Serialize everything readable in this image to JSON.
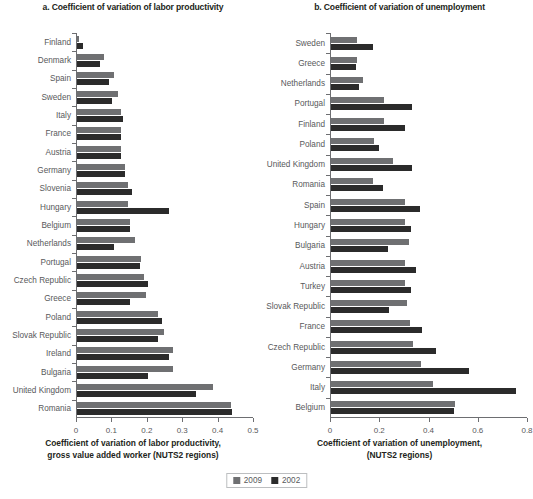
{
  "figure": {
    "legend": {
      "items": [
        {
          "label": "2009",
          "color": "#6f7072"
        },
        {
          "label": "2002",
          "color": "#2b2b2b"
        }
      ]
    }
  },
  "chart_data": [
    {
      "type": "bar",
      "orientation": "horizontal",
      "panel": "a",
      "title": "a. Coefficient of variation of labor productivity",
      "xlabel_line1": "Coefficient of variation of labor productivity,",
      "xlabel_line2": "gross value added worker (NUTS2 regions)",
      "ylabel": "",
      "xlim": [
        0,
        0.5
      ],
      "xticks": [
        0,
        0.1,
        0.2,
        0.3,
        0.4,
        0.5
      ],
      "xtick_labels": [
        "0",
        "0.1",
        "0.2",
        "0.3",
        "0.4",
        "0.5"
      ],
      "grid": false,
      "legend_position": "bottom-center",
      "categories": [
        "Finland",
        "Denmark",
        "Spain",
        "Sweden",
        "Italy",
        "France",
        "Austria",
        "Germany",
        "Slovenia",
        "Hungary",
        "Belgium",
        "Netherlands",
        "Portugal",
        "Czech Republic",
        "Greece",
        "Poland",
        "Slovak Republic",
        "Ireland",
        "Bulgaria",
        "United Kingdom",
        "Romania"
      ],
      "series": [
        {
          "name": "2009",
          "color": "#6f7072",
          "values": [
            0.005,
            0.075,
            0.105,
            0.115,
            0.125,
            0.125,
            0.125,
            0.135,
            0.145,
            0.145,
            0.15,
            0.165,
            0.18,
            0.19,
            0.195,
            0.23,
            0.245,
            0.27,
            0.27,
            0.385,
            0.435
          ]
        },
        {
          "name": "2002",
          "color": "#2b2b2b",
          "values": [
            0.018,
            0.065,
            0.09,
            0.1,
            0.13,
            0.125,
            0.125,
            0.135,
            0.155,
            0.26,
            0.15,
            0.105,
            0.178,
            0.2,
            0.15,
            0.24,
            0.23,
            0.26,
            0.2,
            0.335,
            0.437
          ]
        }
      ]
    },
    {
      "type": "bar",
      "orientation": "horizontal",
      "panel": "b",
      "title": "b. Coefficient of variation of unemployment",
      "xlabel_line1": "Coefficient of variation of unemployment,",
      "xlabel_line2": "(NUTS2 regions)",
      "ylabel": "",
      "xlim": [
        0,
        0.8
      ],
      "xticks": [
        0,
        0.2,
        0.4,
        0.6,
        0.8
      ],
      "xtick_labels": [
        "0",
        "0.2",
        "0.4",
        "0.6",
        "0.8"
      ],
      "grid": false,
      "legend_position": "bottom-center",
      "categories": [
        "Sweden",
        "Greece",
        "Netherlands",
        "Portugal",
        "Finland",
        "Poland",
        "United Kingdom",
        "Romania",
        "Spain",
        "Hungary",
        "Bulgaria",
        "Austria",
        "Turkey",
        "Slovak Republic",
        "France",
        "Czech Republic",
        "Germany",
        "Italy",
        "Belgium"
      ],
      "series": [
        {
          "name": "2009",
          "color": "#6f7072",
          "values": [
            0.105,
            0.105,
            0.13,
            0.215,
            0.215,
            0.175,
            0.25,
            0.17,
            0.3,
            0.3,
            0.315,
            0.3,
            0.3,
            0.31,
            0.32,
            0.335,
            0.365,
            0.415,
            0.505
          ]
        },
        {
          "name": "2002",
          "color": "#2b2b2b",
          "values": [
            0.17,
            0.1,
            0.115,
            0.33,
            0.3,
            0.195,
            0.33,
            0.21,
            0.36,
            0.325,
            0.23,
            0.345,
            0.325,
            0.235,
            0.37,
            0.425,
            0.56,
            0.75,
            0.5
          ]
        }
      ]
    }
  ]
}
